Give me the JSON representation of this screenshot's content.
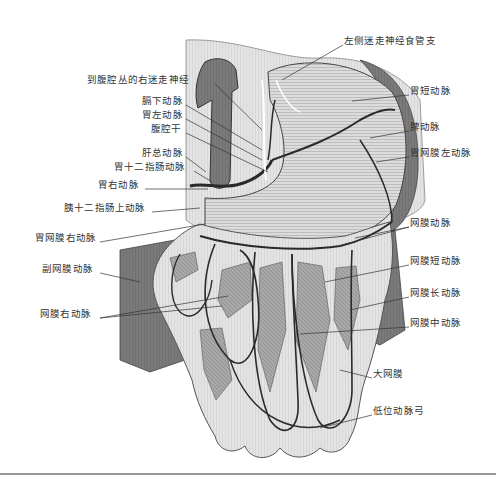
{
  "figure": {
    "colors": {
      "background": "#ffffff",
      "tissue_light": "#e6e6e6",
      "tissue_mid": "#b8b8b8",
      "tissue_dark": "#6e6e6e",
      "vessel": "#2a2a2a",
      "leader_line": "#333333",
      "label_text": "#333333",
      "rule": "#999999"
    }
  },
  "labels": {
    "left": [
      {
        "id": "right-vagus-to-celiac",
        "text": "到腹腔丛的右迷走神经",
        "x": 87,
        "y": 79
      },
      {
        "id": "inferior-phrenic-artery",
        "text": "膈下动脉",
        "x": 142,
        "y": 100
      },
      {
        "id": "left-gastric-artery",
        "text": "胃左动脉",
        "x": 142,
        "y": 114
      },
      {
        "id": "celiac-trunk",
        "text": "腹腔干",
        "x": 151,
        "y": 128
      },
      {
        "id": "common-hepatic-artery",
        "text": "肝总动脉",
        "x": 142,
        "y": 152
      },
      {
        "id": "gastroduodenal-artery",
        "text": "胃十二指肠动脉",
        "x": 114,
        "y": 166
      },
      {
        "id": "right-gastric-artery",
        "text": "胃右动脉",
        "x": 98,
        "y": 184
      },
      {
        "id": "supraduodenal-artery",
        "text": "胰十二指肠上动脉",
        "x": 64,
        "y": 207
      },
      {
        "id": "right-gastroepiploic-artery",
        "text": "胃网膜右动脉",
        "x": 35,
        "y": 237
      },
      {
        "id": "accessory-omental-artery",
        "text": "副网膜动脉",
        "x": 42,
        "y": 268
      },
      {
        "id": "right-omental-artery",
        "text": "网膜右动脉",
        "x": 40,
        "y": 313
      }
    ],
    "right": [
      {
        "id": "left-vagus-esophageal-branch",
        "text": "左侧迷走神经食管支",
        "x": 344,
        "y": 40
      },
      {
        "id": "short-gastric-artery",
        "text": "胃短动脉",
        "x": 410,
        "y": 90
      },
      {
        "id": "splenic-artery",
        "text": "脾动脉",
        "x": 410,
        "y": 126
      },
      {
        "id": "left-gastroepiploic-artery",
        "text": "胃网膜左动脉",
        "x": 410,
        "y": 152
      },
      {
        "id": "omental-artery",
        "text": "网膜动脉",
        "x": 410,
        "y": 222
      },
      {
        "id": "short-omental-artery",
        "text": "网膜短动脉",
        "x": 410,
        "y": 260
      },
      {
        "id": "long-omental-artery",
        "text": "网膜长动脉",
        "x": 410,
        "y": 292
      },
      {
        "id": "middle-omental-artery",
        "text": "网膜中动脉",
        "x": 410,
        "y": 322
      },
      {
        "id": "greater-omentum",
        "text": "大网膜",
        "x": 373,
        "y": 373
      },
      {
        "id": "low-arterial-arc",
        "text": "低位动脉弓",
        "x": 373,
        "y": 410
      }
    ]
  }
}
